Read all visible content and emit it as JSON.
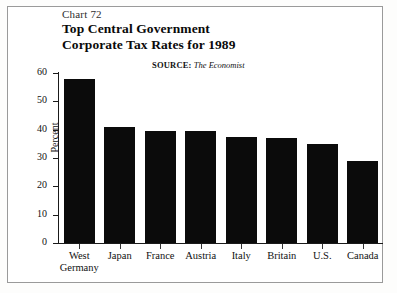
{
  "figure": {
    "chart_number": "Chart 72",
    "title_line_1": "Top Central Government",
    "title_line_2": "Corporate Tax Rates for 1989",
    "source_label": "SOURCE:",
    "source_name": "The Economist"
  },
  "chart_data": {
    "type": "bar",
    "title": "Top Central Government Corporate Tax Rates for 1989",
    "categories": [
      "West Germany",
      "Japan",
      "France",
      "Austria",
      "Italy",
      "Britain",
      "U.S.",
      "Canada"
    ],
    "category_lines": [
      [
        "West",
        "Germany"
      ],
      [
        "Japan",
        ""
      ],
      [
        "France",
        ""
      ],
      [
        "Austria",
        ""
      ],
      [
        "Italy",
        ""
      ],
      [
        "Britain",
        ""
      ],
      [
        "U.S.",
        ""
      ],
      [
        "Canada",
        ""
      ]
    ],
    "values": [
      58,
      41,
      39.5,
      39.5,
      37.5,
      37,
      35,
      29
    ],
    "xlabel": "",
    "ylabel": "Percent",
    "ylim": [
      0,
      60
    ],
    "yticks": [
      60,
      50,
      40,
      30,
      20,
      10,
      0
    ],
    "ytick_labels": [
      "60",
      "50",
      "40",
      "30",
      "20",
      "10",
      "0"
    ],
    "grid": false,
    "legend": false,
    "bar_color": "#0b0b0b",
    "axis_color": "#1a1a1a",
    "background": "#ffffff"
  }
}
